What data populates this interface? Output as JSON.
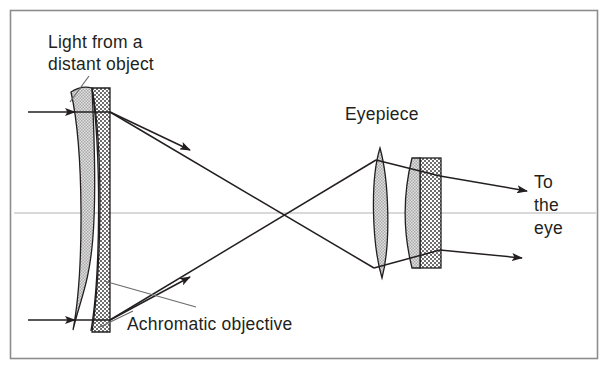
{
  "figure": {
    "border_color": "#8d8d8d",
    "ray_color": "#231f20",
    "axis_color": "#b3b3b3",
    "glass_fill": "#cfcfcf",
    "crown_fill": "#c9c9c9",
    "flint_fill": "#9a9a9a",
    "outline_color": "#231f20"
  },
  "labels": {
    "light_source": "Light from a\ndistant object",
    "eyepiece": "Eyepiece",
    "objective": "Achromatic objective",
    "to_the_eye": "To\nthe\neye"
  },
  "components": {
    "objective": {
      "name": "Achromatic objective",
      "type": "cemented-doublet",
      "elements": [
        "biconvex crown",
        "checkered flint"
      ],
      "x_left": 70,
      "x_right": 110,
      "y_top": 88,
      "y_bottom": 332
    },
    "eyepiece": {
      "name": "Eyepiece",
      "type": "two-group",
      "elements": [
        "field lens biconvex",
        "eye lens doublet"
      ],
      "field_lens": {
        "x_left": 368,
        "x_right": 392,
        "y_top": 148,
        "y_bottom": 278
      },
      "eye_lens": {
        "x_left": 405,
        "x_right": 441,
        "y_top": 158,
        "y_bottom": 268
      }
    },
    "optical_axis": {
      "y": 213,
      "x_start": 14,
      "x_end": 596
    }
  },
  "rays": [
    {
      "name": "upper-incoming-ray",
      "from": [
        28,
        112
      ],
      "to": [
        110,
        112
      ],
      "arrow": true
    },
    {
      "name": "lower-incoming-ray",
      "from": [
        28,
        320
      ],
      "to": [
        110,
        320
      ],
      "arrow": true
    },
    {
      "name": "upper-converging-ray",
      "from": [
        110,
        112
      ],
      "to": [
        372,
        268
      ],
      "arrow": true
    },
    {
      "name": "lower-converging-ray",
      "from": [
        110,
        320
      ],
      "to": [
        372,
        160
      ],
      "arrow": true
    },
    {
      "name": "upper-exit-ray",
      "from": [
        440,
        177
      ],
      "to": [
        527,
        191
      ],
      "arrow": true
    },
    {
      "name": "lower-exit-ray",
      "from": [
        436,
        239
      ],
      "to": [
        522,
        258
      ],
      "arrow": true
    }
  ],
  "leaders": [
    {
      "name": "light-source-leader",
      "from": [
        88,
        77
      ],
      "to": [
        70,
        101
      ]
    },
    {
      "name": "objective-leader",
      "from": [
        196,
        308
      ],
      "to": [
        106,
        283
      ]
    },
    {
      "name": "objective-leader-lower",
      "from": [
        128,
        312
      ],
      "to": [
        100,
        326
      ]
    }
  ]
}
